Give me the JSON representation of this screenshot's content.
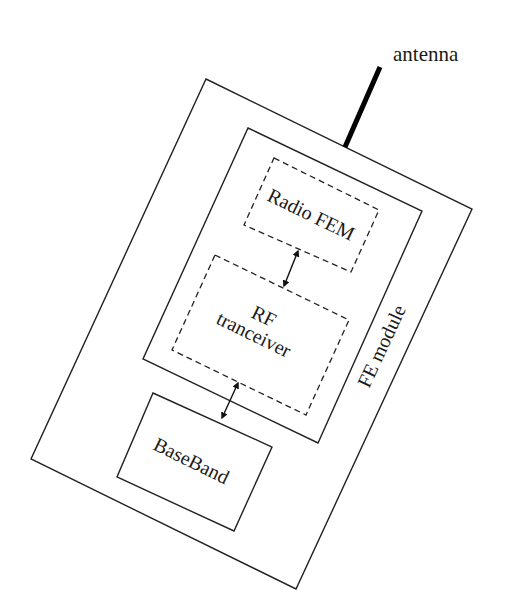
{
  "diagram": {
    "type": "block-diagram",
    "colors": {
      "stroke": "#222222",
      "background": "#ffffff",
      "text": "#1a1a1a"
    },
    "antenna": {
      "label": "antenna"
    },
    "outer_module": {
      "label": "FE module"
    },
    "rf_chip": {
      "label": ""
    },
    "blocks": [
      {
        "id": "radio-fem",
        "label": "Radio FEM",
        "style": "dashed"
      },
      {
        "id": "rf-transceiver",
        "label_line1": "RF",
        "label_line2": "tranceiver",
        "style": "dashed"
      },
      {
        "id": "baseband",
        "label": "BaseBand",
        "style": "solid"
      }
    ],
    "connections": [
      {
        "from": "Radio FEM",
        "to": "RF tranceiver",
        "type": "bidirectional"
      },
      {
        "from": "RF tranceiver",
        "to": "BaseBand",
        "type": "bidirectional"
      }
    ]
  }
}
